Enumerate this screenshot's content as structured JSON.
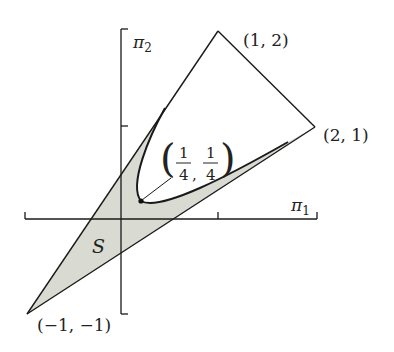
{
  "diagram": {
    "axes": {
      "x_label": "π",
      "x_sub": "1",
      "y_label": "π",
      "y_sub": "2",
      "ticks": {
        "x": [
          1
        ],
        "y": [
          1
        ]
      }
    },
    "vertices": [
      {
        "label": "(1, 2)",
        "x": 1,
        "y": 2
      },
      {
        "label": "(2, 1)",
        "x": 2,
        "y": 1
      },
      {
        "label": "(−1, −1)",
        "x": -1,
        "y": -1
      }
    ],
    "special_point": {
      "num_x": "1",
      "den_x": "4",
      "num_y": "1",
      "den_y": "4",
      "x": 0.25,
      "y": 0.25
    },
    "region_label": "S",
    "colors": {
      "stroke": "#1a1a1a",
      "fill": "#d9dbd3",
      "background": "#ffffff"
    }
  }
}
